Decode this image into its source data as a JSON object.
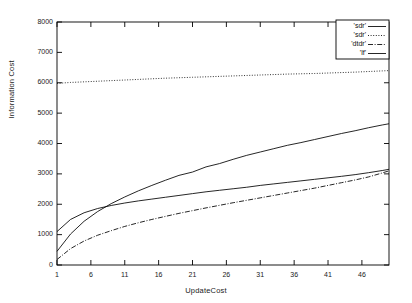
{
  "chart_data": {
    "type": "line",
    "title": "",
    "xlabel": "UpdateCost",
    "ylabel": "Information Cost",
    "xlim": [
      1,
      50
    ],
    "ylim": [
      0,
      8000
    ],
    "grid": false,
    "legend_position": "top-right",
    "xticks": [
      "1",
      "6",
      "11",
      "16",
      "21",
      "26",
      "31",
      "36",
      "41",
      "46"
    ],
    "xtick_values": [
      1,
      6,
      11,
      16,
      21,
      26,
      31,
      36,
      41,
      46
    ],
    "yticks": [
      "0",
      "1000",
      "2000",
      "3000",
      "4000",
      "5000",
      "6000",
      "7000",
      "8000"
    ],
    "ytick_values": [
      0,
      1000,
      2000,
      3000,
      4000,
      5000,
      6000,
      7000,
      8000
    ],
    "x": [
      1,
      3,
      5,
      7,
      9,
      11,
      13,
      15,
      17,
      19,
      21,
      23,
      25,
      27,
      29,
      31,
      33,
      35,
      37,
      39,
      41,
      43,
      45,
      47,
      49,
      50
    ],
    "series": [
      {
        "name": "'sdr'",
        "style": "solid",
        "values": [
          1100,
          1500,
          1720,
          1860,
          1960,
          2040,
          2110,
          2170,
          2230,
          2290,
          2350,
          2410,
          2460,
          2510,
          2560,
          2620,
          2670,
          2720,
          2770,
          2820,
          2870,
          2920,
          2975,
          3040,
          3110,
          3150
        ]
      },
      {
        "name": "'sdr'",
        "style": "dotted",
        "values": [
          5980,
          6010,
          6030,
          6050,
          6070,
          6090,
          6110,
          6130,
          6150,
          6165,
          6180,
          6195,
          6210,
          6225,
          6240,
          6255,
          6270,
          6285,
          6295,
          6305,
          6320,
          6335,
          6350,
          6370,
          6390,
          6400
        ]
      },
      {
        "name": "'dtdr'",
        "style": "dashdot",
        "values": [
          180,
          540,
          790,
          980,
          1130,
          1270,
          1390,
          1500,
          1600,
          1700,
          1790,
          1880,
          1965,
          2050,
          2130,
          2210,
          2290,
          2370,
          2450,
          2530,
          2620,
          2710,
          2800,
          2900,
          3030,
          3100
        ]
      },
      {
        "name": "'lf'",
        "style": "solid",
        "values": [
          450,
          1020,
          1440,
          1760,
          2020,
          2240,
          2440,
          2620,
          2790,
          2950,
          3060,
          3230,
          3340,
          3480,
          3610,
          3720,
          3830,
          3940,
          4030,
          4130,
          4230,
          4330,
          4420,
          4520,
          4610,
          4650
        ]
      }
    ]
  },
  "legend": {
    "entries": [
      {
        "label": "'sdr'"
      },
      {
        "label": "'sdr'"
      },
      {
        "label": "'dtdr'"
      },
      {
        "label": "'lf'"
      }
    ]
  }
}
